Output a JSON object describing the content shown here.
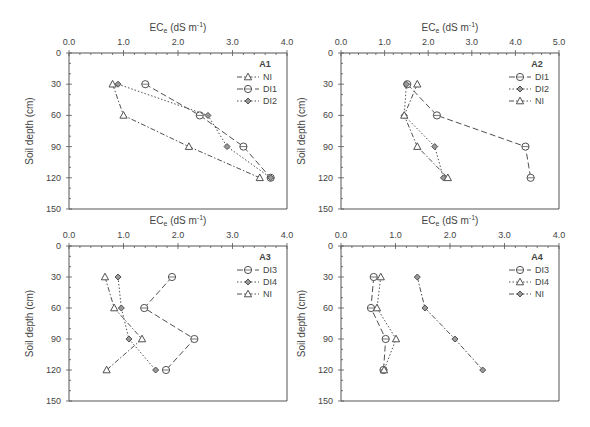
{
  "chart_data": [
    {
      "id": "A1",
      "type": "line",
      "panel_label": "A1",
      "xlabel": "ECe (dS m-1)",
      "ylabel": "Soil depth (cm)",
      "xlim": [
        0,
        4
      ],
      "xticks": [
        "0.0",
        "1.0",
        "2.0",
        "3.0",
        "4.0"
      ],
      "ylim": [
        0,
        150
      ],
      "yticks": [
        "0",
        "30",
        "60",
        "90",
        "120",
        "150"
      ],
      "y_inverted": true,
      "x_axis_position": "top",
      "grid": false,
      "legend_position": "upper-right",
      "depth": [
        30,
        60,
        90,
        120
      ],
      "series": [
        {
          "name": "NI",
          "marker": "triangle",
          "dash": "dashdot",
          "values": [
            0.8,
            1.0,
            2.2,
            3.5
          ]
        },
        {
          "name": "DI1",
          "marker": "circle",
          "dash": "dash",
          "values": [
            1.4,
            2.4,
            3.2,
            3.7
          ]
        },
        {
          "name": "DI2",
          "marker": "diamond",
          "dash": "dot",
          "values": [
            0.9,
            2.55,
            2.9,
            3.7
          ]
        }
      ]
    },
    {
      "id": "A2",
      "type": "line",
      "panel_label": "A2",
      "xlabel": "ECe (dS m-1)",
      "ylabel": "Soil depth (cm)",
      "xlim": [
        0,
        5
      ],
      "xticks": [
        "0.0",
        "1.0",
        "2.0",
        "3.0",
        "4.0",
        "5.0"
      ],
      "ylim": [
        0,
        150
      ],
      "yticks": [
        "0",
        "30",
        "60",
        "90",
        "120",
        "150"
      ],
      "y_inverted": true,
      "x_axis_position": "top",
      "grid": false,
      "legend_position": "upper-right",
      "depth": [
        30,
        60,
        90,
        120
      ],
      "series": [
        {
          "name": "DI1",
          "marker": "circle",
          "dash": "dash",
          "values": [
            1.52,
            2.2,
            4.23,
            4.35
          ]
        },
        {
          "name": "DI2",
          "marker": "diamond",
          "dash": "dot",
          "values": [
            1.5,
            1.45,
            2.15,
            2.35
          ]
        },
        {
          "name": "NI",
          "marker": "triangle",
          "dash": "dashdot",
          "values": [
            1.75,
            1.45,
            1.75,
            2.45
          ]
        }
      ]
    },
    {
      "id": "A3",
      "type": "line",
      "panel_label": "A3",
      "xlabel": "ECe (dS m-1)",
      "ylabel": "Soil depth (cm)",
      "xlim": [
        0,
        4
      ],
      "xticks": [
        "0.0",
        "1.0",
        "2.0",
        "3.0",
        "4.0"
      ],
      "ylim": [
        0,
        150
      ],
      "yticks": [
        "0",
        "30",
        "60",
        "90",
        "120",
        "150"
      ],
      "y_inverted": true,
      "x_axis_position": "top",
      "grid": false,
      "legend_position": "upper-right",
      "depth": [
        30,
        60,
        90,
        120
      ],
      "series": [
        {
          "name": "DI3",
          "marker": "circle",
          "dash": "dash",
          "values": [
            1.89,
            1.38,
            2.3,
            1.78
          ]
        },
        {
          "name": "DI4",
          "marker": "diamond",
          "dash": "dot",
          "values": [
            0.9,
            0.96,
            1.1,
            1.59
          ]
        },
        {
          "name": "NI",
          "marker": "triangle",
          "dash": "dashdot",
          "values": [
            0.66,
            0.83,
            1.34,
            0.69
          ]
        }
      ]
    },
    {
      "id": "A4",
      "type": "line",
      "panel_label": "A4",
      "xlabel": "ECe (dS m-1)",
      "ylabel": "Soil depth (cm)",
      "xlim": [
        0,
        4
      ],
      "xticks": [
        "0.0",
        "1.0",
        "2.0",
        "3.0",
        "4.0"
      ],
      "ylim": [
        0,
        150
      ],
      "yticks": [
        "0",
        "30",
        "60",
        "90",
        "120",
        "150"
      ],
      "y_inverted": true,
      "x_axis_position": "top",
      "grid": false,
      "legend_position": "upper-right",
      "depth": [
        30,
        60,
        90,
        120
      ],
      "series": [
        {
          "name": "DI3",
          "marker": "circle",
          "dash": "dash",
          "values": [
            0.6,
            0.55,
            0.82,
            0.78
          ]
        },
        {
          "name": "DI4",
          "marker": "triangle",
          "dash": "dot",
          "values": [
            0.73,
            0.66,
            1.01,
            0.79
          ]
        },
        {
          "name": "NI",
          "marker": "diamond",
          "dash": "dashdot",
          "values": [
            1.4,
            1.54,
            2.09,
            2.6
          ]
        }
      ]
    }
  ],
  "labels": {
    "xlabel_main": "EC",
    "xlabel_sub": "e",
    "xlabel_unit": " (dS m",
    "xlabel_sup": "-1",
    "xlabel_close": ")",
    "ylabel": "Soil depth (cm)"
  },
  "colors": {
    "axis": "#555555",
    "line": "#505050",
    "marker_fill": "#ffffff",
    "text": "#444444"
  }
}
